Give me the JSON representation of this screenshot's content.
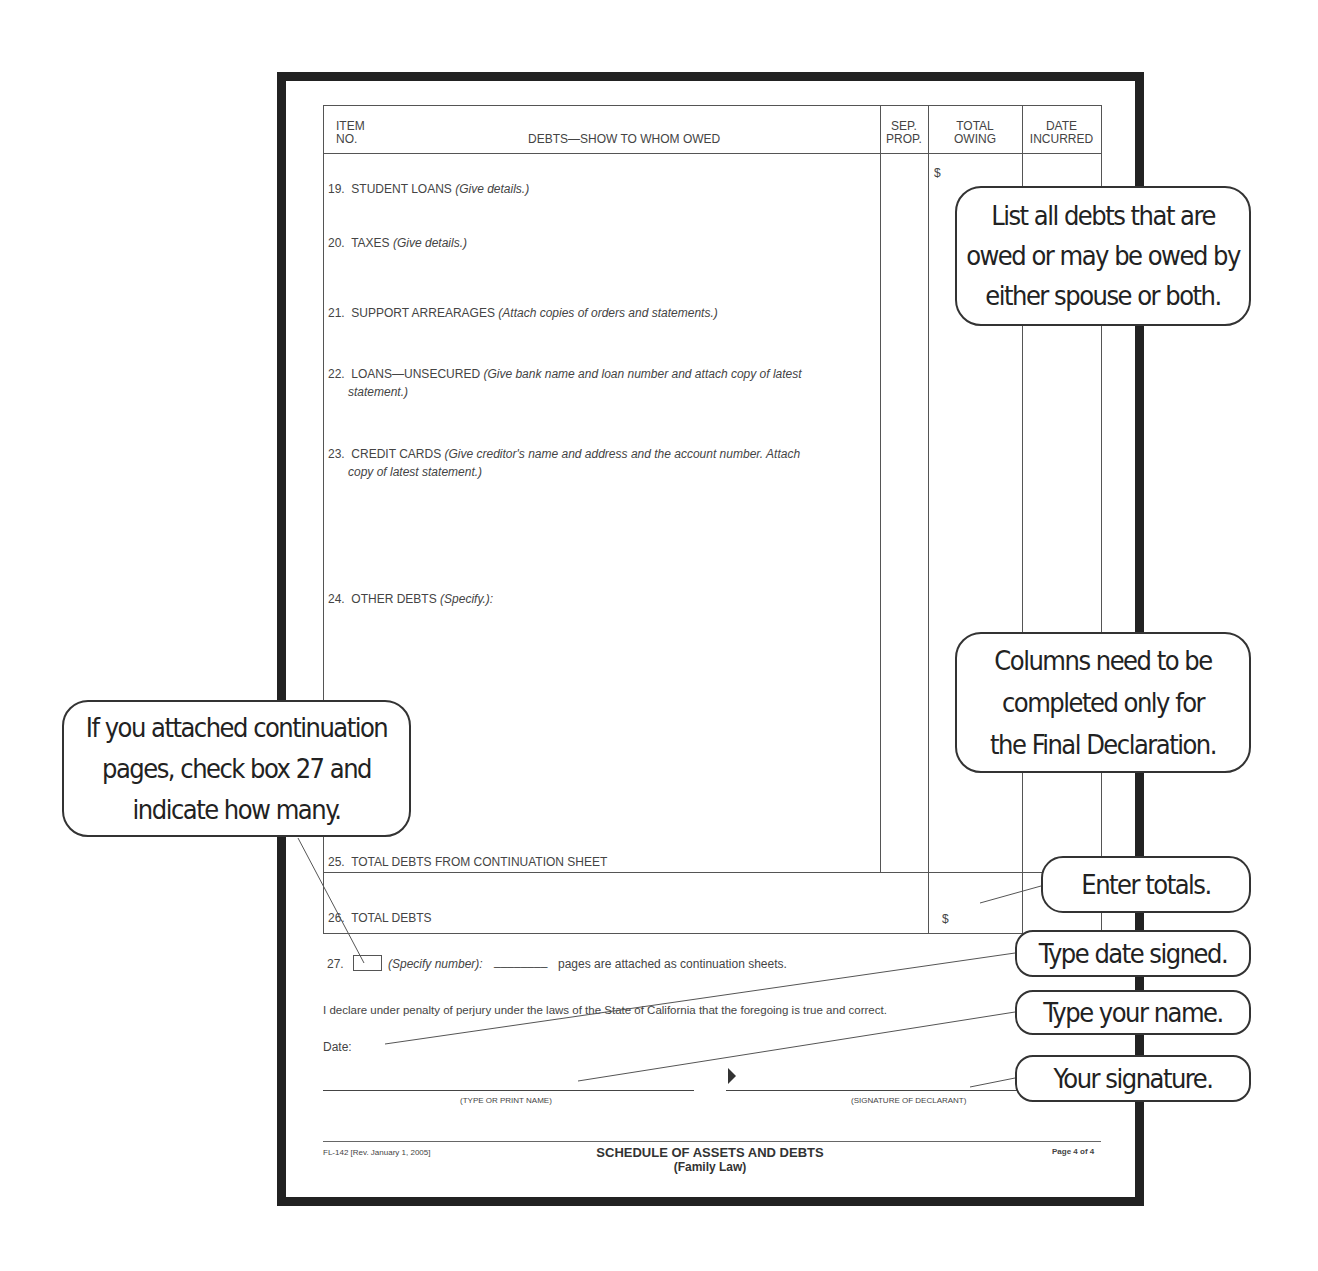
{
  "form": {
    "table_header": {
      "item_no": "ITEM\nNO.",
      "item_line1": "ITEM",
      "item_line2": "NO.",
      "debts": "DEBTS—SHOW TO WHOM OWED",
      "sep_prop_line1": "SEP.",
      "sep_prop_line2": "PROP.",
      "total_owing_line1": "TOTAL",
      "total_owing_line2": "OWING",
      "date_incurred_line1": "DATE",
      "date_incurred_line2": "INCURRED"
    },
    "currency_symbol": "$",
    "rows": [
      {
        "num": "19.",
        "label": "STUDENT LOANS",
        "hint": "(Give details.)",
        "hint2": ""
      },
      {
        "num": "20.",
        "label": "TAXES",
        "hint": "(Give details.)",
        "hint2": ""
      },
      {
        "num": "21.",
        "label": "SUPPORT ARREARAGES",
        "hint": "(Attach copies of orders and statements.)",
        "hint2": ""
      },
      {
        "num": "22.",
        "label": "LOANS—UNSECURED",
        "hint": "(Give bank name and loan number and attach copy of latest",
        "hint2": "statement.)"
      },
      {
        "num": "23.",
        "label": "CREDIT CARDS",
        "hint": "(Give creditor's name and address and the account number. Attach",
        "hint2": "copy of latest statement.)"
      },
      {
        "num": "24.",
        "label": "OTHER DEBTS",
        "hint": "(Specify.):",
        "hint2": ""
      },
      {
        "num": "25.",
        "label": "TOTAL DEBTS FROM CONTINUATION SHEET",
        "hint": "",
        "hint2": ""
      },
      {
        "num": "26.",
        "label": "TOTAL DEBTS",
        "hint": "",
        "hint2": ""
      }
    ],
    "continuation": {
      "num": "27.",
      "specify": "(Specify number):",
      "blank": "________",
      "text": "pages are attached as continuation sheets."
    },
    "declaration": "I declare under penalty of perjury under the laws of the State of California that the foregoing is true and correct.",
    "date_label": "Date:",
    "name_caption": "(TYPE OR PRINT NAME)",
    "signature_caption": "(SIGNATURE OF DECLARANT)",
    "footer": {
      "form_id": "FL-142 [Rev. January 1, 2005]",
      "title": "SCHEDULE OF ASSETS AND DEBTS",
      "subtitle": "(Family Law)",
      "page": "Page 4 of 4"
    }
  },
  "callouts": {
    "list_debts": [
      "List all debts that are",
      "owed or may be owed by",
      "either spouse or both."
    ],
    "columns": [
      "Columns need to be",
      "completed only for",
      "the Final Declaration."
    ],
    "continuation": [
      "If you attached continuation",
      "pages, check box 27 and",
      "indicate how many."
    ],
    "totals": "Enter totals.",
    "date": "Type date signed.",
    "name": "Type your name.",
    "signature": "Your signature."
  }
}
